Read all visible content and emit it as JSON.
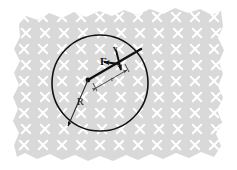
{
  "figure": {
    "type": "physics-diagram",
    "background_color": "#d8d8d8",
    "field_mark_color": "#ffffff",
    "ink_color": "#1a1a1a",
    "canvas": {
      "width": 237,
      "height": 170
    }
  },
  "field": {
    "name": "magnetic-field-into-page",
    "symbol": "x",
    "direction": "into-page",
    "grid": {
      "cols": 11,
      "rows": 9,
      "spacing_x": 19,
      "spacing_y": 16,
      "origin_x": 24,
      "origin_y": 17
    }
  },
  "circle": {
    "name": "particle-orbit",
    "cx": 100,
    "cy": 83,
    "r": 48,
    "stroke": "#111111",
    "stroke_width": 1.6
  },
  "chord": {
    "name": "radius-vector-line",
    "x1": 88,
    "y1": 80,
    "x2": 141,
    "y2": 49,
    "stroke_width": 2.4
  },
  "center_dot": {
    "cx": 88,
    "cy": 80,
    "r": 2.4
  },
  "vectors": [
    {
      "id": "force",
      "label": "F",
      "bold": true,
      "x1": 119,
      "y1": 64,
      "x2": 104,
      "y2": 62,
      "description": "centripetal force arrow pointing left"
    },
    {
      "id": "velocity",
      "label": "v",
      "bold": true,
      "x1": 116,
      "y1": 50,
      "x2": 121,
      "y2": 70,
      "description": "velocity arrow directed down-right along tangent"
    }
  ],
  "dimensions": [
    {
      "id": "big-radius",
      "label": "R",
      "x1": 88,
      "y1": 80,
      "x2": 68,
      "y2": 126,
      "arrow": "end",
      "description": "radius of the large circular region"
    },
    {
      "id": "small-radius",
      "label": "r",
      "x1": 94,
      "y1": 86,
      "x2": 128,
      "y2": 66,
      "arrow": "both",
      "description": "orbit radius measured along the chord"
    }
  ],
  "labels": {
    "force": "F",
    "velocity": "v",
    "big_radius": "R",
    "small_radius": "r"
  }
}
